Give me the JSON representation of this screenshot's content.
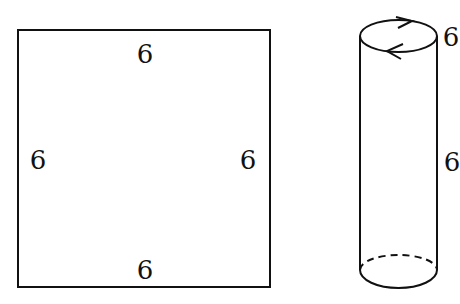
{
  "square": {
    "labels": {
      "top": "6",
      "left": "6",
      "right": "6",
      "bottom": "6"
    }
  },
  "cylinder": {
    "labels": {
      "top": "6",
      "side": "6"
    },
    "top_arrows": "circulation arrows (clockwise on top rim)"
  },
  "colors": {
    "stroke": "#111111",
    "background": "#ffffff"
  }
}
